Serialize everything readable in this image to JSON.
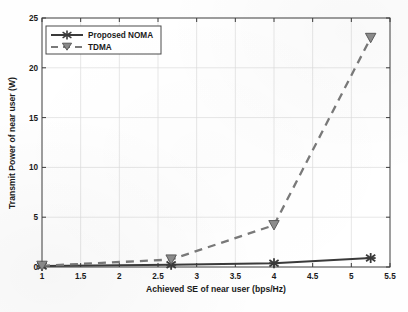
{
  "chart_data": {
    "type": "line",
    "title": "",
    "xlabel": "Achieved SE of near user (bps/Hz)",
    "ylabel": "Transmit Power of near user (W)",
    "xlim": [
      1,
      5.5
    ],
    "ylim": [
      0,
      25
    ],
    "xticks": [
      "1",
      "1.5",
      "2",
      "2.5",
      "3",
      "3.5",
      "4",
      "4.5",
      "5",
      "5.5"
    ],
    "xtick_values": [
      1,
      1.5,
      2,
      2.5,
      3,
      3.5,
      4,
      4.5,
      5,
      5.5
    ],
    "yticks": [
      "0",
      "5",
      "10",
      "15",
      "20",
      "25"
    ],
    "ytick_values": [
      0,
      5,
      10,
      15,
      20,
      25
    ],
    "grid": true,
    "legend_position": "upper left",
    "series": [
      {
        "name": "Proposed NOMA",
        "color": "#3a3a3a",
        "linestyle": "solid",
        "marker": "star",
        "x": [
          1.0,
          2.67,
          4.0,
          5.25
        ],
        "values": [
          0.1,
          0.22,
          0.38,
          0.9
        ]
      },
      {
        "name": "TDMA",
        "color": "#7a7a7a",
        "linestyle": "dashed",
        "marker": "triangle-down",
        "x": [
          1.0,
          2.67,
          4.0,
          5.25
        ],
        "values": [
          0.12,
          0.75,
          4.2,
          23.0
        ]
      }
    ]
  },
  "legend": {
    "items": [
      {
        "label": "Proposed NOMA"
      },
      {
        "label": "TDMA"
      }
    ]
  },
  "colors": {
    "noma": "#3a3a3a",
    "tdma": "#7a7a7a",
    "axis": "#3d3d3d",
    "grid": "#dcdcdc",
    "background": "#fefefe"
  }
}
